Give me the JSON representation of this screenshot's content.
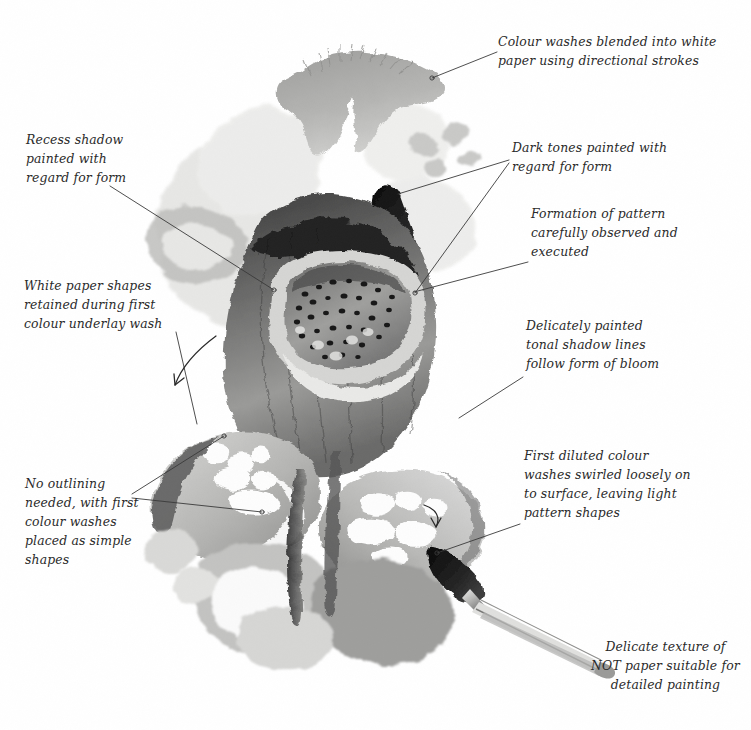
{
  "page": {
    "background_color": "#ffffff",
    "ink_color": "#2a2a2a",
    "leader_line_color": "#3a3a3a"
  },
  "annotations": [
    {
      "id": "colour-washes-blended",
      "text": "Colour washes blended into white\npaper using directional strokes",
      "align": "left",
      "x": 498,
      "y": 35,
      "width": 220,
      "leader": {
        "from": [
          497,
          52
        ],
        "to": [
          432,
          78
        ],
        "endpoint_dot": true
      }
    },
    {
      "id": "recess-shadow",
      "text": "Recess shadow\npainted with\nregard for form",
      "align": "left",
      "x": 26,
      "y": 133,
      "width": 140,
      "leader": {
        "from": [
          110,
          186
        ],
        "to": [
          274,
          290
        ],
        "endpoint_dot": true
      }
    },
    {
      "id": "dark-tones-painted",
      "text": "Dark tones painted with\nregard for form",
      "align": "left",
      "x": 512,
      "y": 140,
      "width": 200,
      "leader": {
        "from": [
          509,
          160
        ],
        "to": [
          402,
          196
        ],
        "endpoint_dot": false
      },
      "leader2": {
        "from": [
          509,
          163
        ],
        "to": [
          415,
          294
        ],
        "endpoint_dot": true
      }
    },
    {
      "id": "formation-of-pattern",
      "text": "Formation of pattern\ncarefully observed and\nexecuted",
      "align": "left",
      "x": 531,
      "y": 206,
      "width": 185,
      "leader": {
        "from": [
          528,
          262
        ],
        "to": [
          412,
          292
        ],
        "endpoint_dot": true
      }
    },
    {
      "id": "white-paper-shapes",
      "text": "White paper shapes\nretained during first\ncolour underlay wash",
      "align": "left",
      "x": 24,
      "y": 278,
      "width": 165,
      "leader": {
        "from": [
          173,
          331
        ],
        "to": [
          193,
          420
        ],
        "endpoint_dot": false
      },
      "arrow": {
        "path": "M 215 336 C 196 350, 181 365, 174 384",
        "head": [
          171,
          390
        ]
      }
    },
    {
      "id": "delicately-painted-tonal",
      "text": "Delicately painted\ntonal shadow lines\nfollow form of bloom",
      "align": "left",
      "x": 526,
      "y": 318,
      "width": 180,
      "leader": {
        "from": [
          523,
          377
        ],
        "to": [
          461,
          417
        ],
        "endpoint_dot": false
      }
    },
    {
      "id": "no-outlining-needed",
      "text": "No outlining\nneeded, with first\ncolour washes\nplaced as simple\nshapes",
      "align": "left",
      "x": 25,
      "y": 477,
      "width": 130,
      "leader": {
        "from": [
          130,
          493
        ],
        "to": [
          222,
          437
        ],
        "endpoint_dot": false
      },
      "leader2": {
        "from": [
          130,
          497
        ],
        "to": [
          263,
          512
        ],
        "endpoint_dot": true
      }
    },
    {
      "id": "first-diluted-colour",
      "text": "First diluted colour\nwashes swirled loosely on\nto surface, leaving light\npattern shapes",
      "align": "left",
      "x": 524,
      "y": 448,
      "width": 200,
      "leader": {
        "from": [
          520,
          524
        ],
        "to": [
          438,
          554
        ],
        "endpoint_dot": true
      },
      "arrow": {
        "path": "M 423 505 C 435 509, 440 516, 436 527",
        "head": [
          433,
          531
        ]
      }
    },
    {
      "id": "delicate-texture-not-paper",
      "text": "Delicate texture of\nNOT paper suitable for\ndetailed painting",
      "align": "center",
      "x": 590,
      "y": 639,
      "width": 150,
      "leader": null
    }
  ],
  "artwork": {
    "type": "watercolour-study",
    "palette": {
      "lightest": "#f2f2f0",
      "pale": "#e3e3e1",
      "light": "#cdcdcb",
      "mid": "#a8a8a6",
      "mid_dark": "#7c7c7b",
      "dark": "#4f4f4f",
      "darkest": "#1d1d1d"
    },
    "elements": [
      {
        "name": "top-sepal-leaf",
        "tone": "mid"
      },
      {
        "name": "upper-left-pale-petal",
        "tone": "pale"
      },
      {
        "name": "upper-right-pale-petal",
        "tone": "pale"
      },
      {
        "name": "dark-spear-leaf",
        "tone": "darkest"
      },
      {
        "name": "bloom-trumpet-throat",
        "tone": "mid_dark"
      },
      {
        "name": "spotted-pattern-interior",
        "tone": "dark"
      },
      {
        "name": "lower-left-petal",
        "tone": "light"
      },
      {
        "name": "lower-right-petal",
        "tone": "light"
      },
      {
        "name": "bottom-petals",
        "tone": "mid"
      },
      {
        "name": "paintbrush",
        "tone": "darkest"
      }
    ],
    "brush": {
      "name": "sable-watercolour-brush",
      "tip_x": 432,
      "tip_y": 545
    }
  }
}
